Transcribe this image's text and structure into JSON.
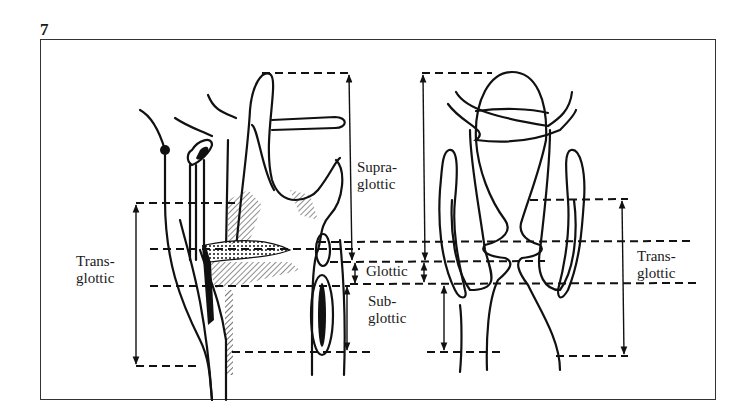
{
  "figure": {
    "number": "7",
    "ink_color": "#111111",
    "background": "#ffffff"
  },
  "labels": {
    "supraglottic": [
      "Supra-",
      "glottic"
    ],
    "glottic": "Glottic",
    "subglottic": [
      "Sub-",
      "glottic"
    ],
    "transglottic_left": [
      "Trans-",
      "glottic"
    ],
    "transglottic_right": [
      "Trans-",
      "glottic"
    ]
  },
  "views": [
    "lateral-section",
    "coronal-section"
  ]
}
